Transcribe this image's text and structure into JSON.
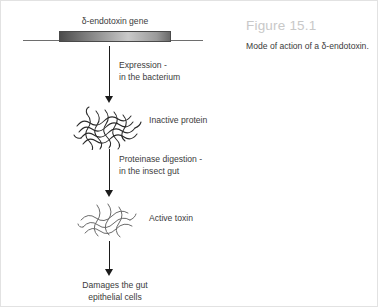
{
  "figure": {
    "number": "Figure 15.1",
    "caption": "Mode of action of a δ-endotoxin."
  },
  "diagram": {
    "gene_label": "δ-endotoxin gene",
    "steps": [
      {
        "line1": "Expression -",
        "line2": "in the bacterium"
      },
      {
        "line1": "Proteinase digestion -",
        "line2": "in the insect gut"
      }
    ],
    "nodes": [
      {
        "label": "Inactive protein",
        "icon": "folded-protein-tangle-dense"
      },
      {
        "label": "Active toxin",
        "icon": "folded-protein-tangle-loose"
      }
    ],
    "outcome": {
      "line1": "Damages the gut",
      "line2": "epithelial cells"
    }
  },
  "colors": {
    "figure_number": "#c8c8c8",
    "text": "#3b3b3b",
    "arrow": "#1b1b1b",
    "gene_box_dark": "#4c4c4c",
    "gene_box_light": "#c9c9c9",
    "dna_line": "#6e6e6e",
    "background": "#ffffff",
    "border": "#e2e2e2"
  }
}
